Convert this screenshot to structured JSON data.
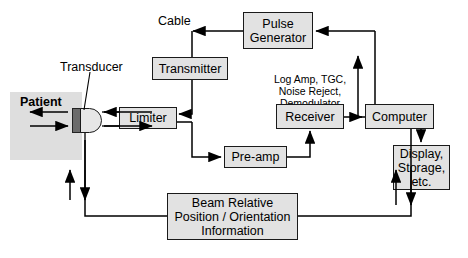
{
  "diagram": {
    "labels": {
      "cable": "Cable",
      "transducer": "Transducer",
      "patient": "Patient",
      "receiver_note": "Log Amp, TGC,\nNoise Reject,\nDemodulator"
    },
    "blocks": {
      "pulse_generator": "Pulse\nGenerator",
      "transmitter": "Transmitter",
      "limiter": "Limiter",
      "preamp": "Pre-amp",
      "receiver": "Receiver",
      "computer": "Computer",
      "display": "Display,\nStorage,\netc.",
      "beam_info": "Beam Relative\nPosition / Orientation\nInformation"
    },
    "colors": {
      "box_fill": "#e2e2e2",
      "patient_fill": "#dedede",
      "transducer_bar": "#6b6b6b",
      "line": "#000000",
      "background": "#ffffff"
    }
  }
}
